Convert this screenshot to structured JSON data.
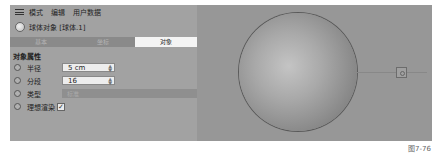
{
  "menubar": {
    "items": [
      "模式",
      "编辑",
      "用户数据"
    ]
  },
  "object_header": {
    "title": "球体对象 [球体.1]"
  },
  "tabs": [
    {
      "label": "基本",
      "active": false
    },
    {
      "label": "坐标",
      "active": false
    },
    {
      "label": "对象",
      "active": true
    }
  ],
  "section_title": "对象属性",
  "properties": {
    "radius": {
      "label": "半径",
      "value": "5 cm"
    },
    "segments": {
      "label": "分段",
      "value": "16"
    },
    "type": {
      "label": "类型",
      "value": "标准"
    },
    "render_perfect": {
      "label": "理想渲染",
      "checked": true,
      "check_glyph": "✓"
    }
  },
  "caption": "图7-76",
  "colors": {
    "panel_bg": "#a2a2a2",
    "viewport_bg": "#979797",
    "active_tab": "#f4f4f4"
  }
}
